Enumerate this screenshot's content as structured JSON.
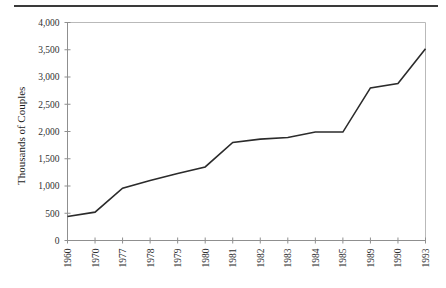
{
  "figure": {
    "top_rule": "decorative-horizontal-rule",
    "background_color": "#ffffff",
    "line_color": "#2b2b2b",
    "axis_color": "#8f8f8f",
    "frame_color": "#b9b9b9"
  },
  "chart_data": {
    "type": "line",
    "title": "",
    "subtitle": "",
    "xlabel": "",
    "ylabel": "Thousands of Couples",
    "categories": [
      "1960",
      "1970",
      "1977",
      "1978",
      "1979",
      "1980",
      "1981",
      "1982",
      "1983",
      "1984",
      "1985",
      "1989",
      "1990",
      "1993"
    ],
    "values": [
      440,
      520,
      960,
      1100,
      1230,
      1350,
      1800,
      1860,
      1890,
      1990,
      1990,
      2800,
      2880,
      3520
    ],
    "ylim": [
      0,
      4000
    ],
    "ytick_labels": [
      "0",
      "500",
      "1,000",
      "1,500",
      "2,000",
      "2,500",
      "3,000",
      "3,500",
      "4,000"
    ],
    "ytick_values": [
      0,
      500,
      1000,
      1500,
      2000,
      2500,
      3000,
      3500,
      4000
    ],
    "xtick_labels": [
      "1960",
      "1970",
      "1977",
      "1978",
      "1979",
      "1980",
      "1981",
      "1982",
      "1983",
      "1984",
      "1985",
      "1989",
      "1990",
      "1993"
    ],
    "grid": false,
    "legend": null,
    "legend_position": "none",
    "annotations": []
  }
}
